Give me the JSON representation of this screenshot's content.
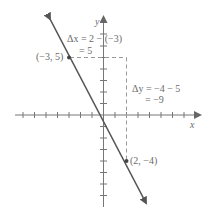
{
  "diagram": {
    "type": "coordinate-plane-slope",
    "axes": {
      "x_label": "x",
      "y_label": "y",
      "x_ticks_range": [
        -8,
        8
      ],
      "y_ticks_range": [
        -8,
        8
      ]
    },
    "points": [
      {
        "label": "(−3, 5)",
        "x": -3,
        "y": 5
      },
      {
        "label": "(2, −4)",
        "x": 2,
        "y": -4
      }
    ],
    "delta_x": {
      "line1": "Δx = 2 − (−3)",
      "line2": "= 5"
    },
    "delta_y": {
      "line1": "Δy = −4 − 5",
      "line2": "= −9"
    },
    "colors": {
      "line": "#555555",
      "axis": "#777777",
      "dashed": "#999999",
      "text": "#6a6a6a"
    }
  }
}
